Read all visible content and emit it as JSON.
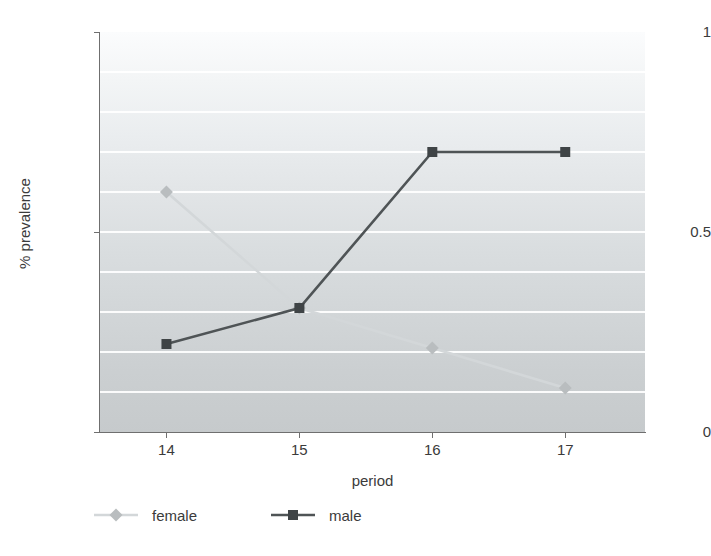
{
  "chart_data": {
    "type": "line",
    "title": "",
    "xlabel": "period",
    "ylabel": "% prevalence",
    "categories": [
      "14",
      "15",
      "16",
      "17"
    ],
    "x": [
      14,
      15,
      16,
      17
    ],
    "xlim": [
      13.5,
      17.6
    ],
    "ylim": [
      0,
      1
    ],
    "ytick_labels": [
      "1",
      "0.5",
      "0"
    ],
    "yticks": [
      1,
      0.5,
      0
    ],
    "grid": true,
    "gridlines_y": [
      0.1,
      0.2,
      0.3,
      0.4,
      0.5,
      0.6,
      0.7,
      0.8,
      0.9
    ],
    "legend_position": "bottom-left",
    "series": [
      {
        "name": "female",
        "values": [
          0.6,
          0.31,
          0.21,
          0.11
        ],
        "color": "#d3d7d9",
        "marker": "diamond",
        "marker_color": "#b9bdbf"
      },
      {
        "name": "male",
        "values": [
          0.22,
          0.31,
          0.7,
          0.7
        ],
        "color": "#4f5456",
        "marker": "square",
        "marker_color": "#3f4446"
      }
    ]
  },
  "axes": {
    "y_title": "% prevalence",
    "x_title": "period",
    "y_labels": [
      "1",
      "0.5",
      "0"
    ],
    "x_labels": [
      "14",
      "15",
      "16",
      "17"
    ]
  },
  "legend": {
    "entries": [
      {
        "label": "female"
      },
      {
        "label": "male"
      }
    ]
  }
}
